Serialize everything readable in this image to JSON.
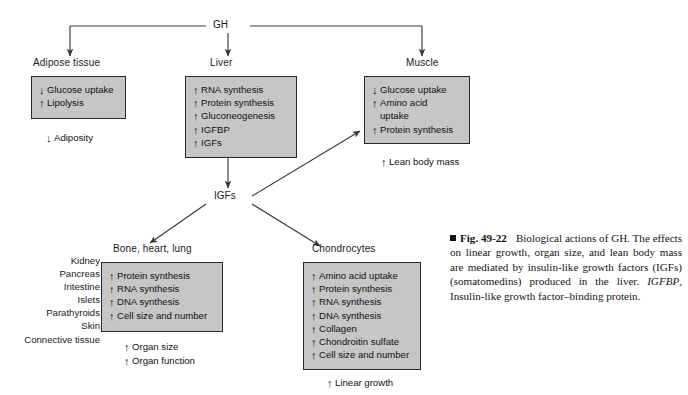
{
  "figure": {
    "hormone": "GH",
    "hub": "IGFs",
    "arrow_up": "↑",
    "arrow_down": "↓"
  },
  "nodes": {
    "adipose": {
      "title": "Adipose tissue",
      "items": [
        {
          "dir": "down",
          "text": "Glucose uptake"
        },
        {
          "dir": "up",
          "text": "Lipolysis"
        }
      ],
      "outcomes": [
        {
          "dir": "down",
          "text": "Adiposity"
        }
      ]
    },
    "liver": {
      "title": "Liver",
      "items": [
        {
          "dir": "up",
          "text": "RNA synthesis"
        },
        {
          "dir": "up",
          "text": "Protein synthesis"
        },
        {
          "dir": "up",
          "text": "Gluconeogenesis"
        },
        {
          "dir": "up",
          "text": "IGFBP"
        },
        {
          "dir": "up",
          "text": "IGFs"
        }
      ],
      "outcomes": []
    },
    "muscle": {
      "title": "Muscle",
      "items": [
        {
          "dir": "down",
          "text": "Glucose uptake"
        },
        {
          "dir": "up",
          "text": "Amino acid"
        },
        {
          "dir": "none",
          "text": "uptake"
        },
        {
          "dir": "up",
          "text": "Protein synthesis"
        }
      ],
      "outcomes": [
        {
          "dir": "up",
          "text": "Lean body mass"
        }
      ]
    },
    "bone": {
      "title": "Bone, heart, lung",
      "organ_list": [
        "Kidney",
        "Pancreas",
        "Intestine",
        "Islets",
        "Parathyroids",
        "Skin",
        "Connective tissue"
      ],
      "items": [
        {
          "dir": "up",
          "text": "Protein synthesis"
        },
        {
          "dir": "up",
          "text": "RNA synthesis"
        },
        {
          "dir": "up",
          "text": "DNA synthesis"
        },
        {
          "dir": "up",
          "text": "Cell size and number"
        }
      ],
      "outcomes": [
        {
          "dir": "up",
          "text": "Organ size"
        },
        {
          "dir": "up",
          "text": "Organ function"
        }
      ]
    },
    "chondrocytes": {
      "title": "Chondrocytes",
      "items": [
        {
          "dir": "up",
          "text": "Amino acid uptake"
        },
        {
          "dir": "up",
          "text": "Protein synthesis"
        },
        {
          "dir": "up",
          "text": "RNA synthesis"
        },
        {
          "dir": "up",
          "text": "DNA synthesis"
        },
        {
          "dir": "up",
          "text": "Collagen"
        },
        {
          "dir": "up",
          "text": "Chondroitin sulfate"
        },
        {
          "dir": "up",
          "text": "Cell size and number"
        }
      ],
      "outcomes": [
        {
          "dir": "up",
          "text": "Linear growth"
        }
      ]
    }
  },
  "caption": {
    "fig_number": "Fig. 49-22",
    "line1": "Biological actions of GH. The",
    "body": "effects on linear growth, organ size, and lean body mass are mediated by insulin-like growth factors (IGFs) (somatomedins) produced in the liver.",
    "italic_term": "IGFBP",
    "definition": ", Insulin-like growth factor–binding protein."
  },
  "colors": {
    "box_fill": "#c6c6c6",
    "box_border": "#2b2b2b",
    "connector": "#3a3a3a",
    "text": "#111111"
  }
}
